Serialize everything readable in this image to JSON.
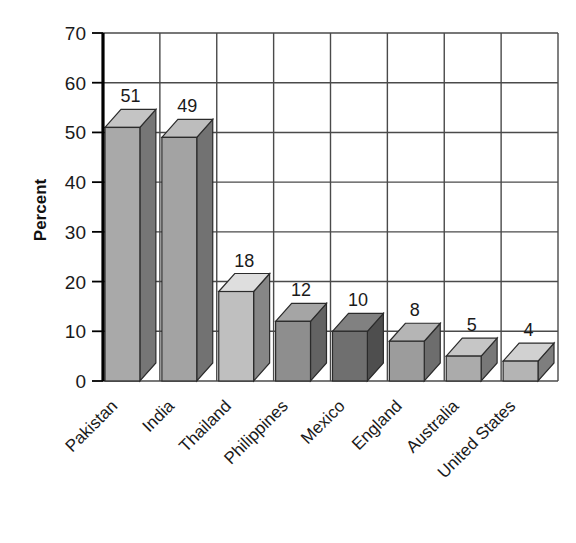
{
  "chart_data": {
    "type": "bar",
    "title": "",
    "subtitle": "",
    "xlabel": "",
    "ylabel": "Percent",
    "categories": [
      "Pakistan",
      "India",
      "Thailand",
      "Philippines",
      "Mexico",
      "England",
      "Australia",
      "United States"
    ],
    "values": [
      51,
      49,
      18,
      12,
      10,
      8,
      5,
      4
    ],
    "value_labels": [
      "51",
      "49",
      "18",
      "12",
      "10",
      "8",
      "5",
      "4"
    ],
    "ylim": [
      0,
      70
    ],
    "yticks": [
      0,
      10,
      20,
      30,
      40,
      50,
      60,
      70
    ],
    "ytick_labels": [
      "0",
      "10",
      "20",
      "30",
      "40",
      "50",
      "60",
      "70"
    ],
    "grid": "both",
    "legend": "none",
    "style": "3d-bars-grayscale",
    "bar_colors": [
      "#a9a9a9",
      "#a3a3a3",
      "#bfbfbf",
      "#8e8e8e",
      "#6f6f6f",
      "#9c9c9c",
      "#ababab",
      "#b4b4b4"
    ],
    "annotations": []
  },
  "axis": {
    "y_title": "Percent"
  },
  "colors": {
    "background": "#ffffff",
    "grid": "#4a4a4a",
    "axis": "#000000",
    "text": "#1a1a1a"
  }
}
